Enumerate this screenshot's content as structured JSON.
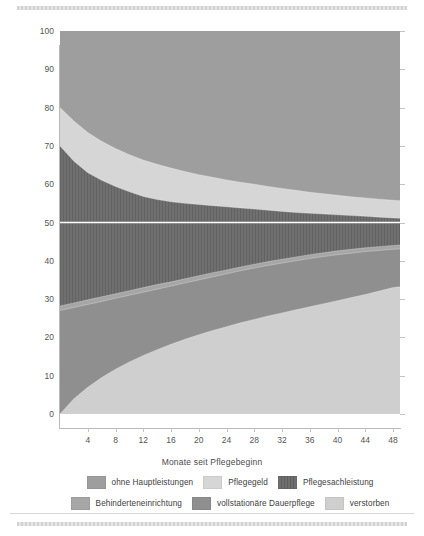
{
  "chart_data": {
    "type": "area",
    "title": "",
    "subtitle": "",
    "xlabel": "Monate seit Pflegebeginn",
    "ylabel": "Anteil in Prozent",
    "xlim": [
      0,
      49
    ],
    "ylim": [
      0,
      100
    ],
    "grid": false,
    "stacked": true,
    "stack_order": "bottom-up",
    "legend_position": "bottom",
    "reference_line": {
      "y": 50,
      "color": "#ffffff",
      "orientation": "horizontal"
    },
    "xticks": [
      4,
      8,
      12,
      16,
      20,
      24,
      28,
      32,
      36,
      40,
      44,
      48
    ],
    "yticks": [
      0,
      10,
      20,
      30,
      40,
      50,
      60,
      70,
      80,
      90,
      100
    ],
    "x": [
      0,
      2,
      4,
      6,
      8,
      10,
      12,
      14,
      16,
      18,
      20,
      22,
      24,
      26,
      28,
      30,
      32,
      34,
      36,
      38,
      40,
      42,
      44,
      46,
      48,
      49
    ],
    "series": [
      {
        "name": "verstorben",
        "color": "#cfcfcf",
        "pattern": "solid",
        "values": [
          0.0,
          4.0,
          7.0,
          9.5,
          11.7,
          13.6,
          15.3,
          16.8,
          18.2,
          19.5,
          20.7,
          21.8,
          22.8,
          23.8,
          24.7,
          25.6,
          26.4,
          27.2,
          28.0,
          28.8,
          29.6,
          30.4,
          31.2,
          32.1,
          33.0,
          33.2
        ]
      },
      {
        "name": "vollstationäre Dauerpflege",
        "color": "#8f8f8f",
        "pattern": "solid",
        "values": [
          27.0,
          27.8,
          28.6,
          29.4,
          30.2,
          31.0,
          31.8,
          32.6,
          33.4,
          34.2,
          35.0,
          35.8,
          36.6,
          37.4,
          38.1,
          38.8,
          39.4,
          40.0,
          40.6,
          41.1,
          41.6,
          42.0,
          42.4,
          42.7,
          43.0,
          43.1
        ]
      },
      {
        "name": "Behinderteneinrichtung",
        "color": "#a6a6a6",
        "pattern": "solid",
        "values": [
          28.2,
          29.0,
          29.8,
          30.6,
          31.4,
          32.2,
          33.0,
          33.8,
          34.5,
          35.3,
          36.1,
          36.9,
          37.6,
          38.4,
          39.1,
          39.8,
          40.4,
          41.0,
          41.6,
          42.1,
          42.6,
          43.0,
          43.4,
          43.7,
          44.0,
          44.1
        ]
      },
      {
        "name": "Pflegesachleistung",
        "color": "#6f6f6f",
        "pattern": "vertical-stripes",
        "values": [
          70.0,
          66.0,
          63.0,
          61.0,
          59.4,
          58.0,
          56.8,
          56.0,
          55.4,
          55.0,
          54.7,
          54.4,
          54.1,
          53.8,
          53.5,
          53.2,
          52.9,
          52.6,
          52.4,
          52.2,
          52.0,
          51.8,
          51.6,
          51.4,
          51.2,
          51.1
        ]
      },
      {
        "name": "Pflegegeld",
        "color": "#d6d6d6",
        "pattern": "solid",
        "values": [
          80.0,
          76.5,
          73.5,
          71.2,
          69.3,
          67.7,
          66.3,
          65.2,
          64.2,
          63.3,
          62.5,
          61.8,
          61.1,
          60.5,
          60.0,
          59.4,
          58.9,
          58.4,
          57.9,
          57.5,
          57.1,
          56.7,
          56.4,
          56.1,
          55.8,
          55.7
        ]
      },
      {
        "name": "ohne Hauptleistungen",
        "color": "#9e9e9e",
        "pattern": "solid",
        "values": [
          100,
          100,
          100,
          100,
          100,
          100,
          100,
          100,
          100,
          100,
          100,
          100,
          100,
          100,
          100,
          100,
          100,
          100,
          100,
          100,
          100,
          100,
          100,
          100,
          100,
          100
        ]
      }
    ],
    "legend": [
      {
        "label": "ohne Hauptleistungen",
        "color": "#9e9e9e",
        "pattern": "solid"
      },
      {
        "label": "Pflegegeld",
        "color": "#d6d6d6",
        "pattern": "solid"
      },
      {
        "label": "Pflegesachleistung",
        "color": "#6f6f6f",
        "pattern": "vertical-stripes"
      },
      {
        "label": "Behinderteneinrichtung",
        "color": "#a6a6a6",
        "pattern": "solid"
      },
      {
        "label": "vollstationäre Dauerpflege",
        "color": "#8f8f8f",
        "pattern": "solid"
      },
      {
        "label": "verstorben",
        "color": "#cfcfcf",
        "pattern": "solid"
      }
    ]
  }
}
